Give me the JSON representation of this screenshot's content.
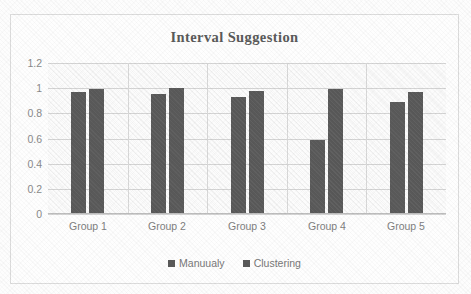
{
  "chart_data": {
    "type": "bar",
    "title": "Interval Suggestion",
    "xlabel": "",
    "ylabel": "",
    "categories": [
      "Group 1",
      "Group 2",
      "Group 3",
      "Group 4",
      "Group 5"
    ],
    "series": [
      {
        "name": "Manuualy",
        "values": [
          0.97,
          0.95,
          0.93,
          0.585,
          0.89
        ],
        "color": "#595959"
      },
      {
        "name": "Clustering",
        "values": [
          0.99,
          1.0,
          0.975,
          0.99,
          0.97
        ],
        "color": "#595959"
      }
    ],
    "ylim": [
      0,
      1.2
    ],
    "yticks": [
      "0",
      "0.2",
      "0.4",
      "0.6",
      "0.8",
      "1",
      "1.2"
    ],
    "ytick_values": [
      0,
      0.2,
      0.4,
      0.6,
      0.8,
      1,
      1.2
    ],
    "grid": true,
    "legend_position": "bottom"
  },
  "legend": {
    "entries": [
      {
        "label": "Manuualy",
        "marker": "square-marker"
      },
      {
        "label": "Clustering",
        "marker": "square-marker"
      }
    ]
  },
  "colors": {
    "bar": "#595959",
    "title_text": "#5a5a5a",
    "tick_text": "#8a8a8a",
    "category_text": "#7e7e7e",
    "legend_text": "#787878",
    "gridline": "#d4d4d4",
    "frame_border": "#dcdcdc",
    "plot_background": "#fcfcfc"
  }
}
